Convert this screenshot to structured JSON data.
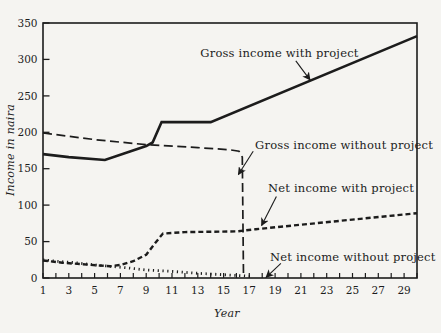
{
  "figure": {
    "paper_color": "#f5f4f1",
    "ink_color": "#1c1c1c"
  },
  "chart_data": {
    "type": "line",
    "title": "",
    "xlabel": "Year",
    "ylabel": "Income in naira",
    "xlim": [
      1,
      30
    ],
    "ylim": [
      0,
      350
    ],
    "grid": false,
    "legend_position": "inline-callouts",
    "x_tick_step": 1,
    "x_label_ticks": [
      1,
      3,
      5,
      7,
      9,
      11,
      13,
      15,
      17,
      19,
      21,
      23,
      25,
      27,
      29
    ],
    "y_ticks": [
      0,
      50,
      100,
      150,
      200,
      250,
      300,
      350
    ],
    "series": [
      {
        "name": "Gross income with project",
        "style": "solid",
        "points": [
          [
            1,
            170
          ],
          [
            3,
            166
          ],
          [
            5.8,
            162
          ],
          [
            9,
            181
          ],
          [
            9.5,
            186
          ],
          [
            10.2,
            214
          ],
          [
            14,
            214
          ],
          [
            30,
            332
          ]
        ]
      },
      {
        "name": "Gross income without project",
        "style": "long-dash",
        "points": [
          [
            1,
            199
          ],
          [
            5,
            190
          ],
          [
            9,
            183
          ],
          [
            13,
            179
          ],
          [
            15.5,
            176
          ],
          [
            16.2,
            174
          ],
          [
            16.45,
            166
          ],
          [
            16.55,
            2
          ]
        ]
      },
      {
        "name": "Net income with project",
        "style": "short-dash",
        "points": [
          [
            1,
            24
          ],
          [
            2.5,
            21
          ],
          [
            4,
            19
          ],
          [
            5.5,
            17
          ],
          [
            6.2,
            16
          ],
          [
            7,
            18
          ],
          [
            8,
            23
          ],
          [
            9,
            32
          ],
          [
            9.7,
            48
          ],
          [
            10.3,
            61
          ],
          [
            12,
            63
          ],
          [
            16,
            64
          ],
          [
            17.5,
            67
          ],
          [
            30,
            89
          ]
        ]
      },
      {
        "name": "Net income without project",
        "style": "dotted",
        "points": [
          [
            1,
            25
          ],
          [
            2,
            23
          ],
          [
            3.5,
            21
          ],
          [
            5,
            18
          ],
          [
            6.2,
            16
          ],
          [
            7.5,
            14
          ],
          [
            9,
            11
          ],
          [
            11,
            9
          ],
          [
            13,
            6.5
          ],
          [
            15,
            4.5
          ],
          [
            16.5,
            3
          ],
          [
            17.3,
            2
          ]
        ]
      }
    ],
    "annotations": [
      {
        "label": "Gross income with project",
        "text_xy": [
          13.2,
          303
        ],
        "arrow": [
          [
            20.6,
            298
          ],
          [
            21.7,
            272
          ]
        ]
      },
      {
        "label": "Gross income without project",
        "text_xy": [
          17.45,
          177
        ],
        "arrow": [
          [
            17.3,
            174
          ],
          [
            16.15,
            142
          ]
        ]
      },
      {
        "label": "Net income with project",
        "text_xy": [
          18.45,
          118
        ],
        "arrow": [
          [
            19.1,
            112
          ],
          [
            17.95,
            72
          ]
        ]
      },
      {
        "label": "Net income without project",
        "text_xy": [
          18.6,
          23
        ],
        "arrow": [
          [
            19.45,
            20
          ],
          [
            18.3,
            1
          ]
        ]
      }
    ]
  }
}
